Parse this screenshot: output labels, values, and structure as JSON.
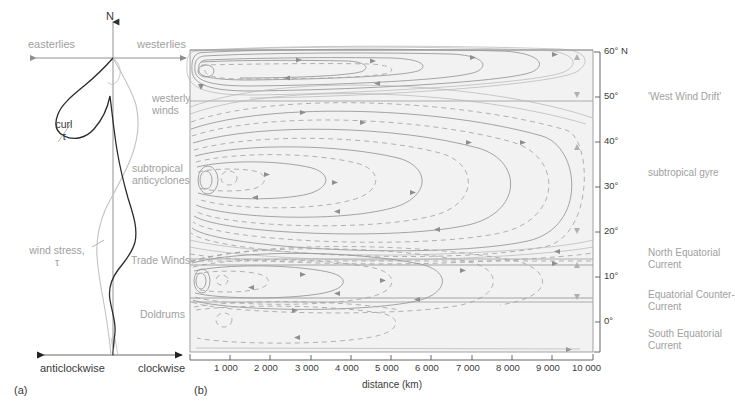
{
  "figure": {
    "panel_a": {
      "caption": "(a)",
      "north_label": "N",
      "top_left_label": "easterlies",
      "top_right_label": "westerlies",
      "curl_label_line1": "curl",
      "curl_label_line2": "τ",
      "wind_stress_label_line1": "wind stress,",
      "wind_stress_label_line2": "τ",
      "bottom_left_label": "anticlockwise",
      "bottom_right_label": "clockwise"
    },
    "wind_bands": [
      {
        "label": "westerly\nwinds",
        "y": 104
      },
      {
        "label": "subtropical\nanticyclones",
        "y": 172
      },
      {
        "label": "Trade Winds",
        "y": 259
      },
      {
        "label": "Doldrums",
        "y": 313
      }
    ],
    "panel_b": {
      "caption": "(b)",
      "xlabel": "distance (km)",
      "xticks": [
        "1 000",
        "2 000",
        "3 000",
        "4 000",
        "5 000",
        "6 000",
        "7 000",
        "8 000",
        "9 000",
        "10 000"
      ],
      "yticks": [
        "60° N",
        "50°",
        "40°",
        "30°",
        "20°",
        "10°",
        "0°"
      ],
      "current_labels": [
        {
          "text": "'West Wind Drift'",
          "y": 96
        },
        {
          "text": "subtropical gyre",
          "y": 172
        },
        {
          "text": "North Equatorial\nCurrent",
          "y": 252
        },
        {
          "text": "Equatorial Counter-\nCurrent",
          "y": 294
        },
        {
          "text": "South Equatorial\nCurrent",
          "y": 333
        }
      ]
    },
    "colors": {
      "plot_background": "#f2f2f2",
      "streamline": "#9a9a9a",
      "label_grey": "#a0a0a0",
      "label_dark": "#3a3a3a",
      "curl_curve": "#2b2b2b",
      "stress_curve": "#c2c2c2"
    }
  },
  "chart_data": {
    "type": "line",
    "title": "",
    "xlabel": "distance (km)",
    "ylabel": "latitude",
    "xlim": [
      0,
      10000
    ],
    "ylim": [
      0,
      60
    ],
    "grid": false,
    "legend": "none",
    "panels": [
      {
        "name": "wind stress and wind stress curl profile",
        "type": "line",
        "xlabel": "",
        "ylabel": "latitude",
        "x_axis_annotations": [
          "anticlockwise",
          "clockwise"
        ],
        "series": [
          {
            "name": "curl τ",
            "style": "solid-dark",
            "points": [
              {
                "lat": 60,
                "value": 0.0
              },
              {
                "lat": 56,
                "value": -0.55
              },
              {
                "lat": 52,
                "value": -0.95
              },
              {
                "lat": 49,
                "value": -1.0
              },
              {
                "lat": 46,
                "value": -0.8
              },
              {
                "lat": 42,
                "value": -0.42
              },
              {
                "lat": 37,
                "value": -0.16
              },
              {
                "lat": 32,
                "value": 0.1
              },
              {
                "lat": 27,
                "value": 0.3
              },
              {
                "lat": 22,
                "value": 0.22
              },
              {
                "lat": 17,
                "value": 0.05
              },
              {
                "lat": 13,
                "value": -0.18
              },
              {
                "lat": 9,
                "value": -0.1
              },
              {
                "lat": 5,
                "value": 0.12
              },
              {
                "lat": 2,
                "value": 0.05
              },
              {
                "lat": 0,
                "value": 0.0
              }
            ]
          },
          {
            "name": "wind stress τ",
            "style": "dashed-light",
            "points": [
              {
                "lat": 60,
                "value": 0.0
              },
              {
                "lat": 55,
                "value": 0.22
              },
              {
                "lat": 50,
                "value": 0.4
              },
              {
                "lat": 45,
                "value": 0.3
              },
              {
                "lat": 40,
                "value": 0.05
              },
              {
                "lat": 35,
                "value": -0.3
              },
              {
                "lat": 30,
                "value": -0.55
              },
              {
                "lat": 25,
                "value": -0.7
              },
              {
                "lat": 20,
                "value": -0.62
              },
              {
                "lat": 15,
                "value": -0.48
              },
              {
                "lat": 10,
                "value": -0.3
              },
              {
                "lat": 5,
                "value": -0.12
              },
              {
                "lat": 0,
                "value": -0.02
              }
            ]
          }
        ]
      },
      {
        "name": "ocean gyre streamlines",
        "type": "contour",
        "xlabel": "distance (km)",
        "ylabel": "latitude",
        "xlim": [
          0,
          10000
        ],
        "ylim": [
          0,
          60
        ],
        "xticks": [
          1000,
          2000,
          3000,
          4000,
          5000,
          6000,
          7000,
          8000,
          9000,
          10000
        ],
        "yticks": [
          0,
          10,
          20,
          30,
          40,
          50,
          60
        ],
        "band_boundaries_lat": [
          50,
          12,
          5
        ],
        "gyres": [
          {
            "name": "'West Wind Drift'",
            "center_lat": 56,
            "center_km": 500,
            "extent_km": 8500,
            "rotation": "anticlockwise"
          },
          {
            "name": "subtropical gyre",
            "center_lat": 30,
            "center_km": 500,
            "extent_km": 9800,
            "rotation": "clockwise"
          },
          {
            "name": "North Equatorial Current / Equatorial Counter-Current",
            "center_lat": 9,
            "center_km": 450,
            "extent_km": 9500,
            "rotation": "anticlockwise"
          },
          {
            "name": "South Equatorial Current",
            "center_lat": 2,
            "center_km": 900,
            "extent_km": 3800,
            "rotation": "clockwise"
          }
        ]
      }
    ]
  }
}
